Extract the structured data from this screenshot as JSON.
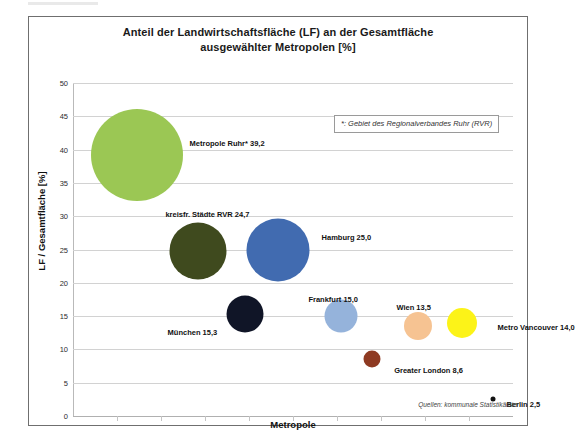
{
  "chart_data": {
    "type": "scatter",
    "title_line1": "Anteil der Landwirtschaftsfläche (LF) an der Gesamtfläche",
    "title_line2": "ausgewählter Metropolen [%]",
    "xlabel": "Metropole",
    "ylabel": "LF / Gesamtfläche [%]",
    "ylim": [
      0,
      50
    ],
    "ytick_labels": [
      "50",
      "45",
      "40",
      "35",
      "30",
      "25",
      "20",
      "15",
      "10",
      "5",
      "0"
    ],
    "ytick_values": [
      50,
      45,
      40,
      35,
      30,
      25,
      20,
      15,
      10,
      5,
      0
    ],
    "grid": true,
    "legend_position": "none",
    "footnote": "*: Gebiet des Regionalverbandes Ruhr (RVR)",
    "source": "Quellen: kommunale Statistikämter",
    "categories": [
      "Metropole Ruhr*",
      "kreisfr. Städte RVR",
      "Hamburg",
      "München",
      "Frankfurt",
      "Wien",
      "Metro Vancouver",
      "Greater London",
      "Berlin"
    ],
    "values": [
      39.2,
      24.7,
      25.0,
      15.3,
      15.0,
      13.5,
      14.0,
      8.6,
      2.5
    ],
    "points": [
      {
        "name": "Metropole Ruhr*",
        "label": "Metropole Ruhr* 39,2",
        "value": 39.2,
        "value_text": "39,2",
        "color": "#9BC754",
        "x_pct": 14.5,
        "size_px": 92,
        "label_x_pct": 26.5,
        "label_y_value": 41.0
      },
      {
        "name": "kreisfr. Städte RVR",
        "label": "kreisfr. Städte RVR 24,7",
        "value": 24.7,
        "value_text": "24,7",
        "color": "#3F4A1E",
        "x_pct": 28.5,
        "size_px": 57,
        "label_x_pct": 21.0,
        "label_y_value": 30.4
      },
      {
        "name": "Hamburg",
        "label": "Hamburg 25,0",
        "value": 25.0,
        "value_text": "25,0",
        "color": "#416BB0",
        "x_pct": 46.5,
        "size_px": 63,
        "label_x_pct": 56.5,
        "label_y_value": 26.9
      },
      {
        "name": "München",
        "label": "München 15,3",
        "value": 15.3,
        "value_text": "15,3",
        "color": "#101527",
        "x_pct": 39.0,
        "size_px": 37,
        "label_x_pct": 21.5,
        "label_y_value": 12.6
      },
      {
        "name": "Frankfurt",
        "label": "Frankfurt 15,0",
        "value": 15.0,
        "value_text": "15,0",
        "color": "#95B3DB",
        "x_pct": 61.0,
        "size_px": 33,
        "label_x_pct": 53.5,
        "label_y_value": 17.6
      },
      {
        "name": "Wien",
        "label": "Wien 13,5",
        "value": 13.5,
        "value_text": "13,5",
        "color": "#F6C392",
        "x_pct": 78.5,
        "size_px": 28,
        "label_x_pct": 73.5,
        "label_y_value": 16.3
      },
      {
        "name": "Metro Vancouver",
        "label": "Metro Vancouver 14,0",
        "value": 14.0,
        "value_text": "14,0",
        "color": "#FCF318",
        "x_pct": 88.5,
        "size_px": 30,
        "label_x_pct": 96.5,
        "label_y_value": 13.3
      },
      {
        "name": "Greater London",
        "label": "Greater London 8,6",
        "value": 8.6,
        "value_text": "8,6",
        "color": "#8E3A22",
        "x_pct": 68.0,
        "size_px": 17,
        "label_x_pct": 73.0,
        "label_y_value": 6.9
      },
      {
        "name": "Berlin",
        "label": "Berlin 2,5",
        "value": 2.5,
        "value_text": "2,5",
        "color": "#111111",
        "x_pct": 95.5,
        "size_px": 5,
        "label_x_pct": 98.5,
        "label_y_value": 1.8
      }
    ]
  }
}
